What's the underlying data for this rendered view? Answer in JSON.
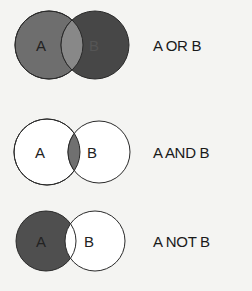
{
  "diagrams": [
    {
      "caption": "A OR B",
      "set_a": "A",
      "set_b": "B"
    },
    {
      "caption": "A AND B",
      "set_a": "A",
      "set_b": "B"
    },
    {
      "caption": "A NOT B",
      "set_a": "A",
      "set_b": "B"
    }
  ],
  "colors": {
    "background": "#f4f4f2",
    "shade_a": "#6e6e6e",
    "shade_b": "#4a4a4a",
    "intersection": "#8a8a8a",
    "stroke": "#2a2a2a"
  }
}
